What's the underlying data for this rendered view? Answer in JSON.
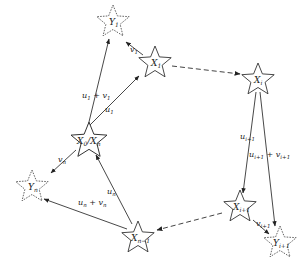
{
  "diagram": {
    "type": "graph",
    "nodes": [
      {
        "id": "Y1",
        "base": "Y",
        "sub": "1",
        "style": "dashed",
        "cx": 113,
        "cy": 22
      },
      {
        "id": "X1",
        "base": "X",
        "sub": "1",
        "style": "solid",
        "cx": 155,
        "cy": 63
      },
      {
        "id": "Xi",
        "base": "X",
        "sub": "i",
        "style": "solid",
        "cx": 258,
        "cy": 80
      },
      {
        "id": "Xi1",
        "base": "X",
        "sub": "i+1",
        "style": "solid",
        "cx": 262,
        "cy": 210
      },
      {
        "id": "Yi1",
        "base": "Y",
        "sub": "i+1",
        "style": "dashed",
        "cx": 285,
        "cy": 242
      },
      {
        "id": "Xn1",
        "base": "X",
        "sub": "n−1",
        "style": "solid",
        "cx": 136,
        "cy": 238
      },
      {
        "id": "X0Xn",
        "base": "X",
        "sub": "0",
        "base2": "X",
        "sub2": "n",
        "style": "solid",
        "cx": 89,
        "cy": 140
      },
      {
        "id": "Yn",
        "base": "Y",
        "sub": "n",
        "style": "dashed",
        "cx": 32,
        "cy": 187
      }
    ],
    "edges": [
      {
        "from": "X0Xn",
        "to": "Y1",
        "style": "solid",
        "label": "u",
        "label_sub": "1",
        "label_plus": "+ v",
        "label_plus_sub": "1"
      },
      {
        "from": "X0Xn",
        "to": "X1",
        "style": "solid",
        "label": "u",
        "label_sub": "1"
      },
      {
        "from": "X1",
        "to": "Y1",
        "style": "solid",
        "label": "v",
        "label_sub": "1"
      },
      {
        "from": "X1",
        "to": "Xi",
        "style": "dashed",
        "label": ""
      },
      {
        "from": "Xi",
        "to": "Xi1",
        "style": "solid",
        "label": "u",
        "label_sub": "i+1"
      },
      {
        "from": "Xi",
        "to": "Yi1",
        "style": "solid",
        "label": "u",
        "label_sub": "i+1",
        "label_plus": "+ v",
        "label_plus_sub": "i+1"
      },
      {
        "from": "Xi1",
        "to": "Yi1",
        "style": "solid",
        "label": "v",
        "label_sub": "i+1"
      },
      {
        "from": "Xi1",
        "to": "Xn1",
        "style": "dashed",
        "label": ""
      },
      {
        "from": "Xn1",
        "to": "X0Xn",
        "style": "solid",
        "label": "u",
        "label_sub": "n"
      },
      {
        "from": "Xn1",
        "to": "Yn",
        "style": "solid",
        "label": "u",
        "label_sub": "n",
        "label_plus": "+ v",
        "label_plus_sub": "n"
      },
      {
        "from": "X0Xn",
        "to": "Yn",
        "style": "solid",
        "label": "v",
        "label_sub": "n"
      }
    ],
    "labels": {
      "Y1": {
        "base": "Y",
        "sub": "1"
      },
      "X1": {
        "base": "X",
        "sub": "1"
      },
      "Xi": {
        "base": "X",
        "sub": "i"
      },
      "Xi1": {
        "base": "X",
        "sub": "i+1"
      },
      "Yi1": {
        "base": "Y",
        "sub": "i+1"
      },
      "Xn1": {
        "base": "X",
        "sub": "n−1"
      },
      "X0Xn_a": {
        "base": "X",
        "sub": "0"
      },
      "X0Xn_slash": "/",
      "X0Xn_b": {
        "base": "X",
        "sub": "n"
      },
      "Yn": {
        "base": "Y",
        "sub": "n"
      },
      "e_u1v1": {
        "a": "u",
        "as": "1",
        "b": " + v",
        "bs": "1"
      },
      "e_u1": {
        "a": "u",
        "as": "1"
      },
      "e_v1": {
        "a": "v",
        "as": "1"
      },
      "e_ui1": {
        "a": "u",
        "as": "i+1"
      },
      "e_ui1vi1": {
        "a": "u",
        "as": "i+1",
        "b": " + v",
        "bs": "i+1"
      },
      "e_vi1": {
        "a": "v",
        "as": "i+1"
      },
      "e_un": {
        "a": "u",
        "as": "n"
      },
      "e_unvn": {
        "a": "u",
        "as": "n",
        "b": " + v",
        "bs": "n"
      },
      "e_vn": {
        "a": "v",
        "as": "n"
      }
    }
  }
}
